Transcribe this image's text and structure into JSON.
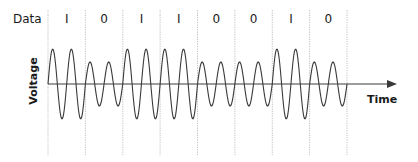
{
  "diagram": {
    "title_label": "Data",
    "y_axis_label": "Voltage",
    "x_axis_label": "Time",
    "bits": [
      "1",
      "0",
      "1",
      "1",
      "0",
      "0",
      "1",
      "0"
    ],
    "modulation": "amplitude-shift keying (2 carrier cycles per bit)",
    "amplitude_high": 35,
    "amplitude_low": 22,
    "cycles_per_bit": 2,
    "colors": {
      "wave": "#3a3a3a",
      "axis": "#3a3a3a",
      "divider": "#b0b0b0",
      "text": "#1a1a1a"
    }
  }
}
